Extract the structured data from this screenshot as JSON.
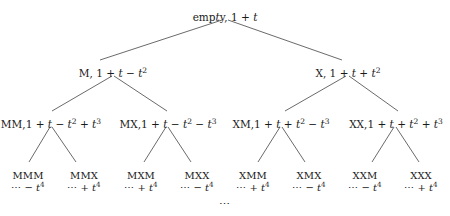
{
  "figure": {
    "name": "sign-word-binary-tree",
    "background_color": "#ffffff",
    "text_color": "#1a1a1a",
    "edge_color": "#444444",
    "bottom_ellipsis": "⋯"
  },
  "tree": {
    "levels": [
      {
        "depth": 0,
        "nodes": [
          {
            "id": "root",
            "word": "empty",
            "label": "empty, 1 + t",
            "x": 225,
            "y": 12
          }
        ]
      },
      {
        "depth": 1,
        "nodes": [
          {
            "id": "M",
            "word": "M",
            "label": "M, 1 + t − t²",
            "x": 113,
            "y": 68
          },
          {
            "id": "X",
            "word": "X",
            "label": "X, 1 + t + t²",
            "x": 348,
            "y": 68
          }
        ]
      },
      {
        "depth": 2,
        "nodes": [
          {
            "id": "MM",
            "word": "MM",
            "label": "MM,1 + t − t² + t³",
            "x": 51,
            "y": 119
          },
          {
            "id": "MX",
            "word": "MX",
            "label": "MX,1 + t − t² − t³",
            "x": 168,
            "y": 119
          },
          {
            "id": "XM",
            "word": "XM",
            "label": "XM,1 + t + t² − t³",
            "x": 281,
            "y": 119
          },
          {
            "id": "XX",
            "word": "XX",
            "label": "XX,1 + t + t² + t³",
            "x": 396,
            "y": 119
          }
        ]
      },
      {
        "depth": 3,
        "nodes": [
          {
            "id": "MMM",
            "word": "MMM",
            "tail": "⋯ − t⁴",
            "x": 28,
            "y": 170
          },
          {
            "id": "MMX",
            "word": "MMX",
            "tail": "⋯ + t⁴",
            "x": 84,
            "y": 170
          },
          {
            "id": "MXM",
            "word": "MXM",
            "tail": "⋯ + t⁴",
            "x": 141,
            "y": 170
          },
          {
            "id": "MXX",
            "word": "MXX",
            "tail": "⋯ − t⁴",
            "x": 197,
            "y": 170
          },
          {
            "id": "XMM",
            "word": "XMM",
            "tail": "⋯ + t⁴",
            "x": 253,
            "y": 170
          },
          {
            "id": "XMX",
            "word": "XMX",
            "tail": "⋯ − t⁴",
            "x": 309,
            "y": 170
          },
          {
            "id": "XXM",
            "word": "XXM",
            "tail": "⋯ − t⁴",
            "x": 365,
            "y": 170
          },
          {
            "id": "XXX",
            "word": "XXX",
            "tail": "⋯ + t⁴",
            "x": 421,
            "y": 170
          }
        ]
      }
    ],
    "edges": [
      {
        "from": "root",
        "to": "M",
        "x1": 222,
        "y1": 20,
        "x2": 100,
        "y2": 60
      },
      {
        "from": "root",
        "to": "X",
        "x1": 228,
        "y1": 20,
        "x2": 342,
        "y2": 60
      },
      {
        "from": "M",
        "to": "MM",
        "x1": 112,
        "y1": 76,
        "x2": 52,
        "y2": 111
      },
      {
        "from": "M",
        "to": "MX",
        "x1": 114,
        "y1": 76,
        "x2": 167,
        "y2": 111
      },
      {
        "from": "X",
        "to": "XM",
        "x1": 346,
        "y1": 76,
        "x2": 285,
        "y2": 111
      },
      {
        "from": "X",
        "to": "XX",
        "x1": 349,
        "y1": 76,
        "x2": 398,
        "y2": 111
      },
      {
        "from": "MM",
        "to": "MMM",
        "x1": 50,
        "y1": 127,
        "x2": 29,
        "y2": 162
      },
      {
        "from": "MM",
        "to": "MMX",
        "x1": 52,
        "y1": 127,
        "x2": 76,
        "y2": 162
      },
      {
        "from": "MX",
        "to": "MXM",
        "x1": 166,
        "y1": 127,
        "x2": 144,
        "y2": 162
      },
      {
        "from": "MX",
        "to": "MXX",
        "x1": 168,
        "y1": 127,
        "x2": 191,
        "y2": 162
      },
      {
        "from": "XM",
        "to": "XMM",
        "x1": 280,
        "y1": 127,
        "x2": 258,
        "y2": 162
      },
      {
        "from": "XM",
        "to": "XMX",
        "x1": 282,
        "y1": 127,
        "x2": 305,
        "y2": 162
      },
      {
        "from": "XX",
        "to": "XXM",
        "x1": 394,
        "y1": 127,
        "x2": 372,
        "y2": 162
      },
      {
        "from": "XX",
        "to": "XXX",
        "x1": 396,
        "y1": 127,
        "x2": 419,
        "y2": 162
      }
    ]
  },
  "bottom": {
    "x": 225,
    "y": 198
  }
}
